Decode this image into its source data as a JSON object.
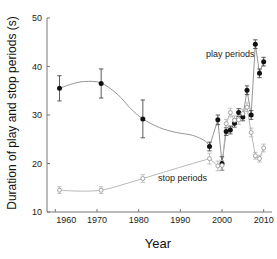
{
  "chart_data": {
    "type": "scatter",
    "title": "",
    "xlabel": "Year",
    "ylabel": "Duration of play and stop periods (s)",
    "xlim": [
      1958,
      2012
    ],
    "ylim": [
      10,
      50
    ],
    "xticks": [
      1960,
      1970,
      1980,
      1990,
      2000,
      2010
    ],
    "xticklabels": [
      "1960",
      "1970",
      "1980",
      "1990",
      "2000",
      "2010"
    ],
    "yticks": [
      10,
      20,
      30,
      40,
      50
    ],
    "yticklabels": [
      "10",
      "20",
      "30",
      "40",
      "50"
    ],
    "grid": false,
    "legend_position": "inline-annotations",
    "annotations": [
      {
        "text": "play periods",
        "x": 2002.0,
        "y": 42.0
      },
      {
        "text": "stop periods",
        "x": 1990.5,
        "y": 16.4
      }
    ],
    "series": [
      {
        "name": "play periods",
        "marker": "filled-circle",
        "color": "#111111",
        "points": [
          {
            "x": 1961,
            "y": 35.5,
            "err": 2.6
          },
          {
            "x": 1971,
            "y": 36.5,
            "err": 3.0
          },
          {
            "x": 1981,
            "y": 29.2,
            "err": 3.9
          },
          {
            "x": 1997,
            "y": 23.5,
            "err": 0.9
          },
          {
            "x": 1999,
            "y": 29.0,
            "err": 1.0
          },
          {
            "x": 2000,
            "y": 20.0,
            "err": 1.4
          },
          {
            "x": 2001,
            "y": 26.6,
            "err": 0.8
          },
          {
            "x": 2002,
            "y": 26.9,
            "err": 0.8
          },
          {
            "x": 2003,
            "y": 28.3,
            "err": 0.8
          },
          {
            "x": 2004,
            "y": 30.5,
            "err": 0.8
          },
          {
            "x": 2005,
            "y": 29.6,
            "err": 0.8
          },
          {
            "x": 2006,
            "y": 35.1,
            "err": 0.9
          },
          {
            "x": 2007,
            "y": 30.0,
            "err": 0.9
          },
          {
            "x": 2008,
            "y": 44.6,
            "err": 0.9
          },
          {
            "x": 2009,
            "y": 38.6,
            "err": 0.9
          },
          {
            "x": 2010,
            "y": 41.0,
            "err": 0.9
          }
        ]
      },
      {
        "name": "stop periods",
        "marker": "open-circle",
        "color": "#9a9a9a",
        "points": [
          {
            "x": 1961,
            "y": 14.5,
            "err": 0.7
          },
          {
            "x": 1971,
            "y": 14.5,
            "err": 0.7
          },
          {
            "x": 1981,
            "y": 16.9,
            "err": 0.8
          },
          {
            "x": 1997,
            "y": 21.0,
            "err": 1.1
          },
          {
            "x": 1999,
            "y": 19.5,
            "err": 1.0
          },
          {
            "x": 2000,
            "y": 19.6,
            "err": 1.0
          },
          {
            "x": 2001,
            "y": 28.2,
            "err": 0.9
          },
          {
            "x": 2002,
            "y": 30.5,
            "err": 0.9
          },
          {
            "x": 2003,
            "y": 28.9,
            "err": 0.9
          },
          {
            "x": 2004,
            "y": 29.0,
            "err": 0.9
          },
          {
            "x": 2005,
            "y": 30.3,
            "err": 0.9
          },
          {
            "x": 2006,
            "y": 31.6,
            "err": 0.9
          },
          {
            "x": 2007,
            "y": 26.4,
            "err": 0.9
          },
          {
            "x": 2008,
            "y": 21.6,
            "err": 0.7
          },
          {
            "x": 2009,
            "y": 21.0,
            "err": 0.7
          },
          {
            "x": 2010,
            "y": 23.2,
            "err": 0.8
          }
        ]
      }
    ],
    "trend_play": [
      {
        "x": 1961,
        "y": 35.5
      },
      {
        "x": 1964,
        "y": 36.4
      },
      {
        "x": 1967,
        "y": 36.9
      },
      {
        "x": 1971,
        "y": 36.6
      },
      {
        "x": 1975,
        "y": 34.2
      },
      {
        "x": 1978,
        "y": 31.4
      },
      {
        "x": 1981,
        "y": 29.2
      },
      {
        "x": 1985,
        "y": 27.4
      },
      {
        "x": 1989,
        "y": 26.4
      },
      {
        "x": 1993,
        "y": 25.8
      },
      {
        "x": 1996,
        "y": 24.6
      },
      {
        "x": 1997,
        "y": 23.5
      }
    ],
    "trend_stop": [
      {
        "x": 1961,
        "y": 14.5
      },
      {
        "x": 1966,
        "y": 14.3
      },
      {
        "x": 1971,
        "y": 14.5
      },
      {
        "x": 1976,
        "y": 15.6
      },
      {
        "x": 1981,
        "y": 16.9
      },
      {
        "x": 1986,
        "y": 18.2
      },
      {
        "x": 1991,
        "y": 19.5
      },
      {
        "x": 1995,
        "y": 20.5
      },
      {
        "x": 1997,
        "y": 21.0
      }
    ]
  }
}
